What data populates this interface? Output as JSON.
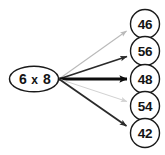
{
  "diagram": {
    "type": "multiple-choice-arrow-diagram",
    "background_color": "#ffffff",
    "stroke_color": "#1a1a1a",
    "hub": {
      "name": "problem-ellipse",
      "expression": "6 x 8",
      "operand_left": "6",
      "operator": "x",
      "operand_right": "8",
      "center_x": 34,
      "center_y": 79,
      "radius_x": 25,
      "radius_y": 13,
      "fill": "#ffffff",
      "stroke": "#1a1a1a"
    },
    "options": [
      {
        "label": "46",
        "center_x": 145,
        "center_y": 24,
        "radius": 15,
        "arrow_color": "#b9b9b9",
        "arrow_width": 1.1,
        "emphasis": "faint"
      },
      {
        "label": "56",
        "center_x": 145,
        "center_y": 51,
        "radius": 15,
        "arrow_color": "#2a2a2a",
        "arrow_width": 1.7,
        "emphasis": "dark"
      },
      {
        "label": "48",
        "center_x": 145,
        "center_y": 79,
        "radius": 15,
        "arrow_color": "#0d0d0d",
        "arrow_width": 3.2,
        "emphasis": "bold"
      },
      {
        "label": "54",
        "center_x": 145,
        "center_y": 106,
        "radius": 15,
        "arrow_color": "#d2d2d2",
        "arrow_width": 1.0,
        "emphasis": "very-faint"
      },
      {
        "label": "42",
        "center_x": 145,
        "center_y": 133,
        "radius": 15,
        "arrow_color": "#2a2a2a",
        "arrow_width": 1.8,
        "emphasis": "dark"
      }
    ]
  }
}
